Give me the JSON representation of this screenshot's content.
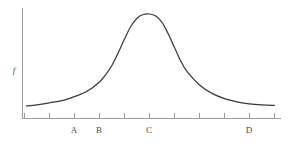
{
  "figure": {
    "background_color": "#ffffff",
    "axis_color": "#9a9a9a",
    "curve_color": "#3a3a3a",
    "label_color": "#4a4a4a"
  },
  "axes": {
    "y_axis_title": "f",
    "y_axis_title_name": "y-axis-title-f",
    "x_axis_title": "",
    "tick_count": 11
  },
  "chart_data": {
    "type": "line",
    "title": "",
    "xlabel": "",
    "ylabel": "f",
    "grid": false,
    "legend": null,
    "x_tick_labels": [
      "",
      "",
      "A",
      "B",
      "",
      "C",
      "",
      "",
      "",
      "D",
      ""
    ],
    "x_tick_positions": [
      0,
      1,
      2,
      3,
      4,
      5,
      6,
      7,
      8,
      9,
      10
    ],
    "labeled_ticks": [
      {
        "label": "A",
        "tick_index": 2
      },
      {
        "label": "B",
        "tick_index": 3
      },
      {
        "label": "C",
        "tick_index": 5
      },
      {
        "label": "D",
        "tick_index": 9
      }
    ],
    "xlim": [
      0,
      10
    ],
    "ylim": [
      0,
      1.08
    ],
    "peak": {
      "x": 5,
      "y": 1.0
    },
    "baseline": {
      "y": 0.12
    },
    "x": [
      0.08,
      0.5,
      1.0,
      1.5,
      2.0,
      2.5,
      3.0,
      3.25,
      3.5,
      3.75,
      4.0,
      4.25,
      4.5,
      4.75,
      5.0,
      5.25,
      5.5,
      5.75,
      6.0,
      6.25,
      6.5,
      7.0,
      7.5,
      8.0,
      8.5,
      9.0,
      9.5,
      10.0
    ],
    "y": [
      0.12,
      0.13,
      0.15,
      0.17,
      0.21,
      0.26,
      0.35,
      0.42,
      0.51,
      0.63,
      0.76,
      0.88,
      0.96,
      0.995,
      1.0,
      0.98,
      0.92,
      0.81,
      0.68,
      0.55,
      0.45,
      0.32,
      0.24,
      0.19,
      0.16,
      0.14,
      0.13,
      0.125
    ],
    "series": [
      {
        "name": "f",
        "x": [
          0.08,
          0.5,
          1.0,
          1.5,
          2.0,
          2.5,
          3.0,
          3.25,
          3.5,
          3.75,
          4.0,
          4.25,
          4.5,
          4.75,
          5.0,
          5.25,
          5.5,
          5.75,
          6.0,
          6.25,
          6.5,
          7.0,
          7.5,
          8.0,
          8.5,
          9.0,
          9.5,
          10.0
        ],
        "y": [
          0.12,
          0.13,
          0.15,
          0.17,
          0.21,
          0.26,
          0.35,
          0.42,
          0.51,
          0.63,
          0.76,
          0.88,
          0.96,
          0.995,
          1.0,
          0.98,
          0.92,
          0.81,
          0.68,
          0.55,
          0.45,
          0.32,
          0.24,
          0.19,
          0.16,
          0.14,
          0.13,
          0.125
        ]
      }
    ]
  },
  "tick_labels": {
    "a": "A",
    "b": "B",
    "c": "C",
    "d": "D"
  }
}
